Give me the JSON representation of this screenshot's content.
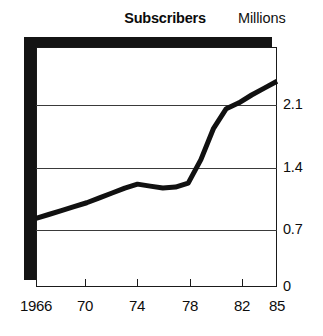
{
  "chart_data": {
    "type": "line",
    "title": "Subscribers",
    "units_label": "Millions",
    "xlabel": "",
    "ylabel": "Millions",
    "grid": true,
    "legend": "none",
    "xlim": [
      1966,
      1985
    ],
    "ylim": [
      0,
      2.45
    ],
    "ytick_values": [
      0,
      0.7,
      1.4,
      2.1
    ],
    "ytick_labels": [
      "0",
      "0.7",
      "1.4",
      "2.1"
    ],
    "xtick_values": [
      1966,
      1970,
      1974,
      1978,
      1982,
      1985
    ],
    "xtick_labels": [
      "1966",
      "70",
      "74",
      "78",
      "82",
      "85"
    ],
    "series": [
      {
        "name": "Subscribers",
        "x": [
          1966,
          1967,
          1968,
          1969,
          1970,
          1971,
          1972,
          1973,
          1974,
          1975,
          1976,
          1977,
          1978,
          1979,
          1980,
          1981,
          1982,
          1983,
          1984,
          1985
        ],
        "values": [
          0.7,
          0.74,
          0.78,
          0.82,
          0.86,
          0.91,
          0.96,
          1.01,
          1.05,
          1.03,
          1.01,
          1.02,
          1.06,
          1.3,
          1.62,
          1.82,
          1.88,
          1.96,
          2.03,
          2.1
        ]
      }
    ]
  },
  "axis": {
    "y_labels": [
      {
        "text": "2.1",
        "top": 96
      },
      {
        "text": "1.4",
        "top": 159
      },
      {
        "text": "0.7",
        "top": 221
      },
      {
        "text": "0",
        "top": 278
      }
    ],
    "x_labels": [
      {
        "text": "1966",
        "left": 12,
        "width": 48
      },
      {
        "text": "70",
        "left": 70,
        "width": 30
      },
      {
        "text": "74",
        "left": 122,
        "width": 30
      },
      {
        "text": "78",
        "left": 175,
        "width": 30
      },
      {
        "text": "82",
        "left": 227,
        "width": 30
      },
      {
        "text": "85",
        "left": 262,
        "width": 30
      }
    ],
    "gridlines": [
      {
        "top": 105
      },
      {
        "top": 168
      },
      {
        "top": 230
      }
    ],
    "xticks": [
      {
        "left": 85
      },
      {
        "left": 137
      },
      {
        "left": 190
      },
      {
        "left": 242
      }
    ]
  },
  "style": {
    "line_color": "#111111",
    "frame_color": "#1a1a1a",
    "shadow_color": "#141414",
    "grid_color": "#3a3a3a",
    "background": "#ffffff"
  }
}
